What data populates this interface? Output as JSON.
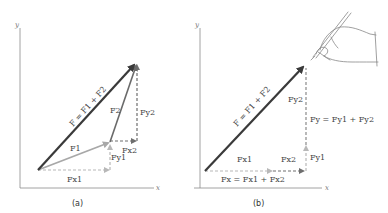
{
  "panels": [
    {
      "caption": "(a)",
      "axes": {
        "x": "x",
        "y": "y"
      },
      "labels": {
        "F_sum": "F = F1 + F2",
        "F1": "F1",
        "F2": "F2",
        "Fx1": "Fx1",
        "Fy1": "Fy1",
        "Fx2": "Fx2",
        "Fy2": "Fy2"
      }
    },
    {
      "caption": "(b)",
      "axes": {
        "x": "x",
        "y": "y"
      },
      "labels": {
        "F_sum": "F = F1 + F2",
        "Fx1": "Fx1",
        "Fx2": "Fx2",
        "Fy1": "Fy1",
        "Fy2": "Fy2",
        "Fx_sum": "Fx = Fx1 + Fx2",
        "Fy_sum": "Fy = Fy1 + Fy2"
      }
    }
  ],
  "colors": {
    "resultant": "#3a3a3a",
    "component_vector": "#a8a8a8",
    "f2_vector": "#6a6a6a",
    "dashed_light": "#b8b8b8",
    "dashed_dark": "#6e6e6e",
    "axis": "#8a8a8a"
  }
}
